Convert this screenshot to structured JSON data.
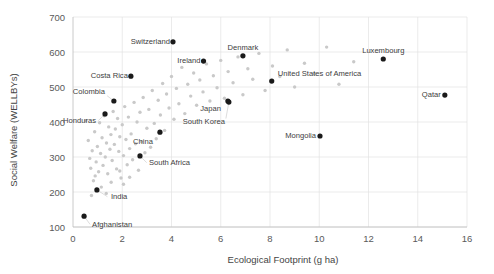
{
  "chart_data": {
    "type": "scatter",
    "title": "",
    "xlabel": "Ecological Footprint (g ha)",
    "ylabel": "Social Welfare (WELLBYs)",
    "xlim": [
      0,
      16
    ],
    "ylim": [
      100,
      700
    ],
    "xticks": [
      0,
      2,
      4,
      6,
      8,
      10,
      12,
      14,
      16
    ],
    "yticks": [
      100,
      200,
      300,
      400,
      500,
      600,
      700
    ],
    "grid": true,
    "legend": "none",
    "series": [
      {
        "name": "Labelled countries",
        "color": "#1a1a1a",
        "points": [
          {
            "label": "Switzerland",
            "x": 4.06,
            "y": 629,
            "label_side": "left"
          },
          {
            "label": "Denmark",
            "x": 6.9,
            "y": 589,
            "label_side": "above"
          },
          {
            "label": "Luxembourg",
            "x": 12.6,
            "y": 580,
            "label_side": "above"
          },
          {
            "label": "Ireland",
            "x": 5.3,
            "y": 574,
            "label_side": "left"
          },
          {
            "label": "Costa Rica",
            "x": 2.35,
            "y": 531,
            "label_side": "left"
          },
          {
            "label": "United States of America",
            "x": 8.07,
            "y": 517,
            "label_side": "above-right"
          },
          {
            "label": "Qatar",
            "x": 15.1,
            "y": 477,
            "label_side": "left"
          },
          {
            "label": "Colombia",
            "x": 1.66,
            "y": 460,
            "label_side": "upper-left"
          },
          {
            "label": "Japan",
            "x": 6.29,
            "y": 460,
            "label_side": "below-left"
          },
          {
            "label": "South Korea",
            "x": 6.33,
            "y": 457,
            "label_side": "below-left"
          },
          {
            "label": "Honduras",
            "x": 1.3,
            "y": 423,
            "label_side": "lower-left"
          },
          {
            "label": "China",
            "x": 3.53,
            "y": 371,
            "label_side": "below-left"
          },
          {
            "label": "Mongolia",
            "x": 10.03,
            "y": 360,
            "label_side": "left"
          },
          {
            "label": "South Africa",
            "x": 2.72,
            "y": 303,
            "label_side": "below-right"
          },
          {
            "label": "India",
            "x": 0.97,
            "y": 206,
            "label_side": "below-right"
          },
          {
            "label": "Afghanistan",
            "x": 0.45,
            "y": 131,
            "label_side": "below-right"
          }
        ]
      },
      {
        "name": "Other countries",
        "color": "#c9c9c9",
        "points": [
          {
            "x": 0.52,
            "y": 404
          },
          {
            "x": 0.62,
            "y": 347
          },
          {
            "x": 0.68,
            "y": 296
          },
          {
            "x": 0.72,
            "y": 268
          },
          {
            "x": 0.78,
            "y": 318
          },
          {
            "x": 0.83,
            "y": 232
          },
          {
            "x": 0.88,
            "y": 372
          },
          {
            "x": 0.94,
            "y": 286
          },
          {
            "x": 0.99,
            "y": 330
          },
          {
            "x": 1.04,
            "y": 258
          },
          {
            "x": 1.08,
            "y": 398
          },
          {
            "x": 1.12,
            "y": 310
          },
          {
            "x": 1.18,
            "y": 355
          },
          {
            "x": 1.22,
            "y": 276
          },
          {
            "x": 1.27,
            "y": 418
          },
          {
            "x": 1.31,
            "y": 300
          },
          {
            "x": 1.36,
            "y": 340
          },
          {
            "x": 1.41,
            "y": 252
          },
          {
            "x": 1.45,
            "y": 386
          },
          {
            "x": 1.5,
            "y": 322
          },
          {
            "x": 1.54,
            "y": 364
          },
          {
            "x": 1.59,
            "y": 290
          },
          {
            "x": 1.63,
            "y": 430
          },
          {
            "x": 1.68,
            "y": 336
          },
          {
            "x": 1.72,
            "y": 380
          },
          {
            "x": 1.77,
            "y": 266
          },
          {
            "x": 1.81,
            "y": 410
          },
          {
            "x": 1.86,
            "y": 316
          },
          {
            "x": 1.9,
            "y": 358
          },
          {
            "x": 1.95,
            "y": 240
          },
          {
            "x": 2.0,
            "y": 392
          },
          {
            "x": 2.05,
            "y": 304
          },
          {
            "x": 2.1,
            "y": 444
          },
          {
            "x": 2.15,
            "y": 350
          },
          {
            "x": 2.2,
            "y": 278
          },
          {
            "x": 2.25,
            "y": 414
          },
          {
            "x": 2.3,
            "y": 324
          },
          {
            "x": 2.36,
            "y": 366
          },
          {
            "x": 2.42,
            "y": 292
          },
          {
            "x": 2.48,
            "y": 456
          },
          {
            "x": 2.54,
            "y": 338
          },
          {
            "x": 2.6,
            "y": 400
          },
          {
            "x": 2.66,
            "y": 262
          },
          {
            "x": 2.72,
            "y": 428
          },
          {
            "x": 2.78,
            "y": 344
          },
          {
            "x": 2.85,
            "y": 470
          },
          {
            "x": 2.92,
            "y": 312
          },
          {
            "x": 3.0,
            "y": 382
          },
          {
            "x": 3.08,
            "y": 436
          },
          {
            "x": 3.15,
            "y": 328
          },
          {
            "x": 3.22,
            "y": 490
          },
          {
            "x": 3.3,
            "y": 396
          },
          {
            "x": 3.38,
            "y": 352
          },
          {
            "x": 3.46,
            "y": 462
          },
          {
            "x": 3.55,
            "y": 420
          },
          {
            "x": 3.64,
            "y": 510
          },
          {
            "x": 3.72,
            "y": 376
          },
          {
            "x": 3.8,
            "y": 480
          },
          {
            "x": 3.9,
            "y": 440
          },
          {
            "x": 4.0,
            "y": 530
          },
          {
            "x": 4.1,
            "y": 408
          },
          {
            "x": 4.2,
            "y": 496
          },
          {
            "x": 4.3,
            "y": 452
          },
          {
            "x": 4.42,
            "y": 556
          },
          {
            "x": 4.54,
            "y": 424
          },
          {
            "x": 4.66,
            "y": 508
          },
          {
            "x": 4.78,
            "y": 474
          },
          {
            "x": 4.9,
            "y": 540
          },
          {
            "x": 5.02,
            "y": 448
          },
          {
            "x": 5.15,
            "y": 520
          },
          {
            "x": 5.28,
            "y": 486
          },
          {
            "x": 5.42,
            "y": 566
          },
          {
            "x": 5.56,
            "y": 460
          },
          {
            "x": 5.7,
            "y": 532
          },
          {
            "x": 5.85,
            "y": 498
          },
          {
            "x": 6.0,
            "y": 576
          },
          {
            "x": 6.15,
            "y": 468
          },
          {
            "x": 6.3,
            "y": 544
          },
          {
            "x": 6.5,
            "y": 512
          },
          {
            "x": 6.7,
            "y": 586
          },
          {
            "x": 6.9,
            "y": 478
          },
          {
            "x": 7.1,
            "y": 552
          },
          {
            "x": 7.3,
            "y": 522
          },
          {
            "x": 7.55,
            "y": 596
          },
          {
            "x": 7.8,
            "y": 490
          },
          {
            "x": 8.1,
            "y": 560
          },
          {
            "x": 8.4,
            "y": 530
          },
          {
            "x": 8.7,
            "y": 606
          },
          {
            "x": 9.0,
            "y": 500
          },
          {
            "x": 9.4,
            "y": 568
          },
          {
            "x": 9.8,
            "y": 538
          },
          {
            "x": 10.3,
            "y": 614
          },
          {
            "x": 10.8,
            "y": 508
          },
          {
            "x": 11.4,
            "y": 572
          },
          {
            "x": 1.15,
            "y": 214
          },
          {
            "x": 1.55,
            "y": 228
          },
          {
            "x": 0.9,
            "y": 246
          },
          {
            "x": 1.35,
            "y": 196
          },
          {
            "x": 2.05,
            "y": 222
          },
          {
            "x": 0.75,
            "y": 190
          },
          {
            "x": 1.9,
            "y": 260
          },
          {
            "x": 2.3,
            "y": 242
          }
        ]
      }
    ]
  },
  "axis": {
    "x_tick_labels": [
      "0",
      "2",
      "4",
      "6",
      "8",
      "10",
      "12",
      "14",
      "16"
    ],
    "y_tick_labels": [
      "100",
      "200",
      "300",
      "400",
      "500",
      "600",
      "700"
    ],
    "x_title": "Ecological Footprint (g ha)",
    "y_title": "Social Welfare (WELLBYs)"
  }
}
